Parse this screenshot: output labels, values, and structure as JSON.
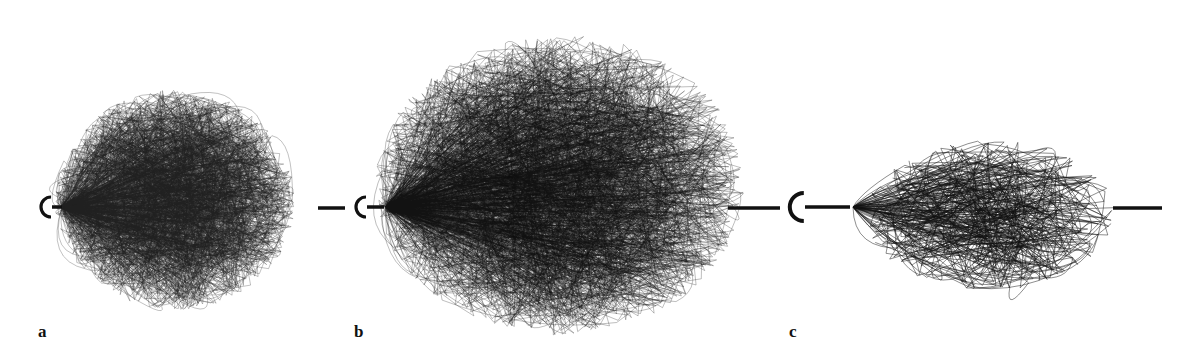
{
  "figure": {
    "panels": [
      {
        "id": "a",
        "label": "a",
        "label_x": 38,
        "label_y": 322,
        "c_x": 44,
        "axis_y": 207,
        "cloud": {
          "cx": 175,
          "cy": 200,
          "rx": 120,
          "ry": 110,
          "tipx": 62
        },
        "left_bar": [
          52,
          62
        ],
        "right_bar": [
          318,
          345
        ],
        "density": 260,
        "stroke": "#222",
        "opacity": 0.35
      },
      {
        "id": "b",
        "label": "b",
        "label_x": 354,
        "label_y": 322,
        "c_x": 359,
        "axis_y": 207,
        "cloud": {
          "cx": 560,
          "cy": 185,
          "rx": 185,
          "ry": 150,
          "tipx": 386
        },
        "left_bar": [
          367,
          384
        ],
        "right_bar": [
          728,
          780
        ],
        "density": 300,
        "stroke": "#111",
        "opacity": 0.35
      },
      {
        "id": "c",
        "label": "c",
        "label_x": 789,
        "label_y": 322,
        "c_x": 794,
        "axis_y": 207,
        "cloud": {
          "cx": 990,
          "cy": 215,
          "rx": 125,
          "ry": 75,
          "tipx": 853
        },
        "left_bar": [
          805,
          850
        ],
        "right_bar": [
          1113,
          1162
        ],
        "density": 70,
        "stroke": "#111",
        "opacity": 0.6
      }
    ],
    "colors": {
      "ink": "#111111",
      "background": "#ffffff"
    }
  }
}
